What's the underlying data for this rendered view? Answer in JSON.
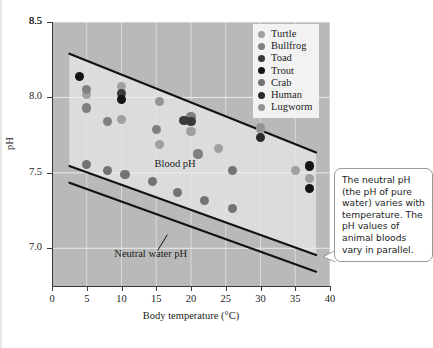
{
  "chart_data": {
    "type": "scatter",
    "title": "",
    "xlabel": "Body temperature (°C)",
    "ylabel": "pH",
    "xlim": [
      0,
      40
    ],
    "ylim": [
      6.75,
      8.5
    ],
    "xticks": [
      0,
      5,
      10,
      15,
      20,
      25,
      30,
      35,
      40
    ],
    "xtick_labels": [
      "0",
      "5",
      "10",
      "15",
      "20",
      "25",
      "30",
      "35",
      "40"
    ],
    "yticks": [
      7.0,
      7.5,
      8.0,
      8.5
    ],
    "ytick_labels": [
      "7.0",
      "7.5",
      "8.0",
      "8.5"
    ],
    "grid": true,
    "legend_position": "top-right",
    "annotations": [
      {
        "text": "Blood pH",
        "x": 18.5,
        "y": 7.555
      },
      {
        "text": "Neutral water pH",
        "x": 14.0,
        "y": 6.955
      }
    ],
    "bands": [
      {
        "name": "Blood pH band",
        "upper_line": [
          [
            2.5,
            8.29
          ],
          [
            38.0,
            7.635
          ]
        ],
        "lower_line": [
          [
            2.5,
            7.545
          ],
          [
            38.0,
            6.955
          ]
        ]
      },
      {
        "name": "Neutral water pH line",
        "line": [
          [
            2.5,
            7.435
          ],
          [
            38.0,
            6.845
          ]
        ]
      }
    ],
    "series": [
      {
        "name": "Turtle",
        "color": "#a0a0a0",
        "points": [
          [
            5.0,
            8.02
          ],
          [
            10.0,
            8.075
          ],
          [
            10.0,
            7.855
          ],
          [
            15.5,
            7.69
          ],
          [
            20.0,
            7.775
          ],
          [
            24.0,
            7.66
          ],
          [
            30.0,
            7.79
          ],
          [
            35.0,
            7.515
          ],
          [
            37.0,
            7.465
          ]
        ]
      },
      {
        "name": "Bullfrog",
        "color": "#808080",
        "points": [
          [
            5.0,
            8.055
          ],
          [
            5.0,
            7.93
          ],
          [
            8.0,
            7.84
          ],
          [
            15.0,
            7.79
          ],
          [
            20.0,
            7.87
          ],
          [
            21.0,
            7.625
          ]
        ]
      },
      {
        "name": "Toad",
        "color": "#3a3a3a",
        "points": [
          [
            10.0,
            8.025
          ],
          [
            19.0,
            7.845
          ],
          [
            20.0,
            7.84
          ]
        ]
      },
      {
        "name": "Trout",
        "color": "#141414",
        "points": [
          [
            4.0,
            8.14
          ],
          [
            10.0,
            7.985
          ],
          [
            37.0,
            7.545
          ],
          [
            37.0,
            7.395
          ]
        ]
      },
      {
        "name": "Crab",
        "color": "#737373",
        "points": [
          [
            5.0,
            7.555
          ],
          [
            8.0,
            7.515
          ],
          [
            10.5,
            7.49
          ],
          [
            14.5,
            7.445
          ],
          [
            18.0,
            7.37
          ],
          [
            22.0,
            7.315
          ],
          [
            26.0,
            7.265
          ],
          [
            26.0,
            7.515
          ]
        ]
      },
      {
        "name": "Human",
        "color": "#2a2a2a",
        "points": [
          [
            30.0,
            7.735
          ]
        ]
      },
      {
        "name": "Lugworm",
        "color": "#949494",
        "points": [
          [
            15.5,
            7.975
          ],
          [
            30.0,
            7.8
          ]
        ]
      }
    ]
  },
  "legend": {
    "items": [
      {
        "label": "Turtle",
        "color": "#a0a0a0"
      },
      {
        "label": "Bullfrog",
        "color": "#808080"
      },
      {
        "label": "Toad",
        "color": "#3a3a3a"
      },
      {
        "label": "Trout",
        "color": "#141414"
      },
      {
        "label": "Crab",
        "color": "#737373"
      },
      {
        "label": "Human",
        "color": "#2a2a2a"
      },
      {
        "label": "Lugworm",
        "color": "#949494"
      }
    ]
  },
  "callout": {
    "text": "The neutral pH (the pH of pure water) varies with temperature. The pH values of animal bloods vary in parallel."
  },
  "colors": {
    "plot_background": "#b9b9b9",
    "band_background": "#dcdcdc",
    "line": "#121212",
    "axis": "#3a3a3a",
    "text": "#1c1c1c",
    "legend_background": "#f2f2f2",
    "callout_border": "#9a9a9a"
  }
}
